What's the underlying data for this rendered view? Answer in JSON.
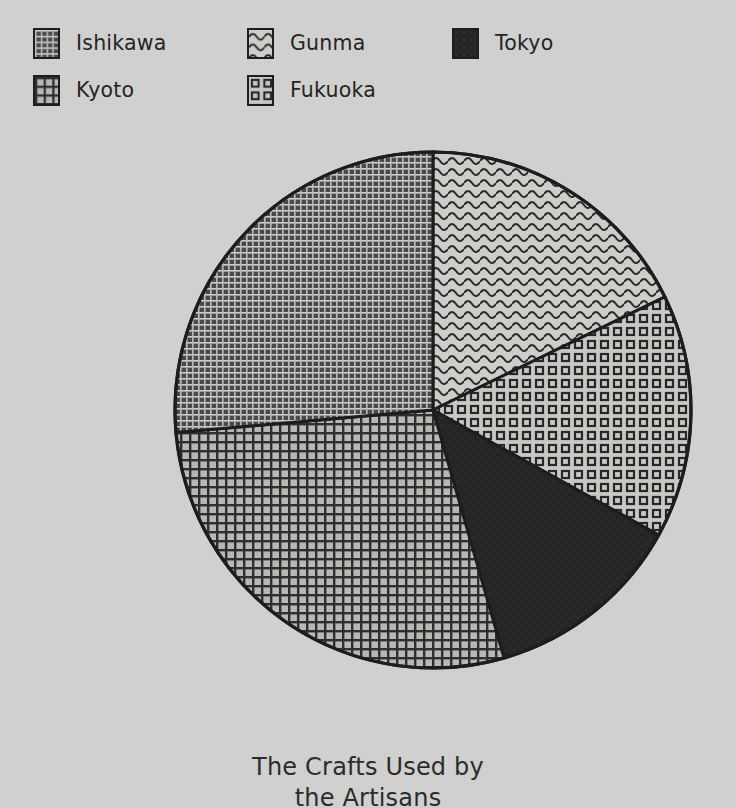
{
  "chart_data": {
    "type": "pie",
    "title": "The Crafts Used by the Artisans",
    "title_line1": "The Crafts Used by",
    "title_line2": "the Artisans",
    "xlabel": "",
    "ylabel": "",
    "grid": false,
    "legend_position": "top",
    "labels": [
      "Ishikawa",
      "Kyoto",
      "Gunma",
      "Fukuoka",
      "Tokyo"
    ],
    "values": [
      26.4,
      28.1,
      17.8,
      15.3,
      12.5
    ],
    "slices": [
      {
        "label": "Ishikawa",
        "value": 26.4,
        "start_angle": 265,
        "end_angle": 360,
        "pattern": "dense-dark-grid",
        "fill": "#4d4d4d",
        "stroke": "#1c1c1c"
      },
      {
        "label": "Kyoto",
        "value": 28.1,
        "start_angle": 164,
        "end_angle": 265,
        "pattern": "crosshatch-grid",
        "fill": "#8f8f8d",
        "stroke": "#1c1c1c"
      },
      {
        "label": "Gunma",
        "value": 17.8,
        "start_angle": 0,
        "end_angle": 64,
        "pattern": "wavy-lines",
        "fill": "#cdcdca",
        "stroke": "#1c1c1c"
      },
      {
        "label": "Fukuoka",
        "value": 15.3,
        "start_angle": 64,
        "end_angle": 119,
        "pattern": "small-squares",
        "fill": "#c8c8c5",
        "stroke": "#1c1c1c"
      },
      {
        "label": "Tokyo",
        "value": 12.5,
        "start_angle": 119,
        "end_angle": 164,
        "pattern": "solid",
        "fill": "#2a2a2a",
        "stroke": "#1c1c1c"
      }
    ],
    "center": {
      "x": 433,
      "y": 410
    },
    "radius": 258,
    "background_color": "#d2d2d0",
    "outline_color": "#1c1c1c"
  },
  "legend": {
    "entries": [
      {
        "label": "Ishikawa",
        "pattern": "dense-dark-grid",
        "swatch_icon": "pattern-swatch-icon"
      },
      {
        "label": "Kyoto",
        "pattern": "crosshatch-grid",
        "swatch_icon": "pattern-swatch-icon"
      },
      {
        "label": "Gunma",
        "pattern": "wavy-lines",
        "swatch_icon": "pattern-swatch-icon"
      },
      {
        "label": "Fukuoka",
        "pattern": "small-squares",
        "swatch_icon": "pattern-swatch-icon"
      },
      {
        "label": "Tokyo",
        "pattern": "solid",
        "swatch_icon": "pattern-swatch-icon"
      }
    ]
  }
}
